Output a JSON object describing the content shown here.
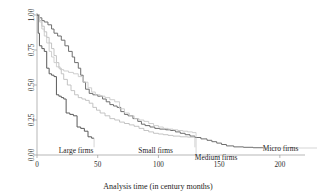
{
  "chart_data": {
    "type": "line",
    "title": "",
    "xlabel": "Analysis time (in century months)",
    "ylabel": "",
    "xlim": [
      0,
      210
    ],
    "ylim": [
      0,
      1.0
    ],
    "xticks": [
      "0",
      "50",
      "100",
      "150",
      "200"
    ],
    "xtick_values": [
      0,
      50,
      100,
      150,
      200
    ],
    "yticks": [
      "0.00",
      "0.25",
      "0.50",
      "0.75",
      "1.00"
    ],
    "ytick_values": [
      0.0,
      0.25,
      0.5,
      0.75,
      1.0
    ],
    "grid": false,
    "legend_position": "inline-annotations",
    "series": [
      {
        "name": "Micro firms",
        "color": "#6e6e6e",
        "width": 1.0,
        "label_x": 186,
        "label_y": 0.055,
        "points": [
          [
            0,
            1.0
          ],
          [
            2,
            0.98
          ],
          [
            4,
            0.96
          ],
          [
            6,
            0.95
          ],
          [
            9,
            0.93
          ],
          [
            12,
            0.9
          ],
          [
            14,
            0.87
          ],
          [
            17,
            0.85
          ],
          [
            20,
            0.82
          ],
          [
            23,
            0.78
          ],
          [
            26,
            0.74
          ],
          [
            29,
            0.7
          ],
          [
            31,
            0.66
          ],
          [
            34,
            0.62
          ],
          [
            36,
            0.57
          ],
          [
            38,
            0.52
          ],
          [
            40,
            0.47
          ],
          [
            43,
            0.44
          ],
          [
            46,
            0.43
          ],
          [
            50,
            0.42
          ],
          [
            54,
            0.4
          ],
          [
            57,
            0.38
          ],
          [
            60,
            0.36
          ],
          [
            63,
            0.35
          ],
          [
            66,
            0.34
          ],
          [
            69,
            0.31
          ],
          [
            72,
            0.29
          ],
          [
            75,
            0.28
          ],
          [
            79,
            0.26
          ],
          [
            83,
            0.24
          ],
          [
            86,
            0.22
          ],
          [
            89,
            0.21
          ],
          [
            93,
            0.2
          ],
          [
            97,
            0.19
          ],
          [
            101,
            0.185
          ],
          [
            106,
            0.18
          ],
          [
            110,
            0.175
          ],
          [
            114,
            0.165
          ],
          [
            118,
            0.155
          ],
          [
            122,
            0.145
          ],
          [
            126,
            0.135
          ],
          [
            130,
            0.125
          ],
          [
            135,
            0.115
          ],
          [
            140,
            0.105
          ],
          [
            144,
            0.095
          ],
          [
            148,
            0.085
          ],
          [
            152,
            0.075
          ],
          [
            156,
            0.065
          ],
          [
            162,
            0.058
          ],
          [
            170,
            0.055
          ],
          [
            178,
            0.052
          ],
          [
            186,
            0.05
          ]
        ]
      },
      {
        "name": "Small firms",
        "color": "#bdbdbd",
        "width": 0.9,
        "label_x": 112,
        "label_y": 0.045,
        "points": [
          [
            0,
            1.0
          ],
          [
            2,
            0.96
          ],
          [
            4,
            0.92
          ],
          [
            6,
            0.88
          ],
          [
            8,
            0.84
          ],
          [
            10,
            0.8
          ],
          [
            12,
            0.76
          ],
          [
            14,
            0.71
          ],
          [
            16,
            0.66
          ],
          [
            18,
            0.62
          ],
          [
            20,
            0.58
          ],
          [
            22,
            0.54
          ],
          [
            25,
            0.5
          ],
          [
            28,
            0.46
          ],
          [
            31,
            0.43
          ],
          [
            34,
            0.41
          ],
          [
            37,
            0.4
          ],
          [
            40,
            0.39
          ],
          [
            43,
            0.37
          ],
          [
            46,
            0.34
          ],
          [
            49,
            0.32
          ],
          [
            52,
            0.3
          ],
          [
            56,
            0.28
          ],
          [
            60,
            0.26
          ],
          [
            64,
            0.25
          ],
          [
            68,
            0.235
          ],
          [
            72,
            0.225
          ],
          [
            76,
            0.215
          ],
          [
            80,
            0.205
          ],
          [
            84,
            0.19
          ],
          [
            88,
            0.175
          ],
          [
            92,
            0.165
          ],
          [
            96,
            0.155
          ],
          [
            100,
            0.15
          ],
          [
            104,
            0.145
          ],
          [
            108,
            0.14
          ],
          [
            112,
            0.135
          ],
          [
            118,
            0.13
          ],
          [
            124,
            0.128
          ],
          [
            130,
            0.125
          ]
        ]
      },
      {
        "name": "Medium firms",
        "color": "#c9c9c9",
        "width": 0.9,
        "label_x": 130,
        "label_y": -0.01,
        "points": [
          [
            0,
            1.0
          ],
          [
            2,
            0.95
          ],
          [
            4,
            0.9
          ],
          [
            6,
            0.85
          ],
          [
            8,
            0.8
          ],
          [
            10,
            0.74
          ],
          [
            12,
            0.7
          ],
          [
            14,
            0.66
          ],
          [
            16,
            0.63
          ],
          [
            19,
            0.61
          ],
          [
            22,
            0.6
          ],
          [
            26,
            0.59
          ],
          [
            30,
            0.58
          ],
          [
            34,
            0.56
          ],
          [
            38,
            0.52
          ],
          [
            42,
            0.48
          ],
          [
            45,
            0.45
          ],
          [
            48,
            0.43
          ],
          [
            52,
            0.42
          ],
          [
            56,
            0.41
          ],
          [
            60,
            0.395
          ],
          [
            64,
            0.38
          ],
          [
            68,
            0.33
          ],
          [
            72,
            0.3
          ],
          [
            76,
            0.28
          ],
          [
            80,
            0.26
          ],
          [
            84,
            0.25
          ],
          [
            88,
            0.24
          ],
          [
            92,
            0.225
          ],
          [
            96,
            0.21
          ],
          [
            100,
            0.2
          ],
          [
            104,
            0.19
          ],
          [
            108,
            0.185
          ],
          [
            112,
            0.18
          ],
          [
            116,
            0.175
          ],
          [
            120,
            0.17
          ],
          [
            124,
            0.165
          ],
          [
            128,
            0.16
          ],
          [
            131,
            0.155
          ]
        ]
      },
      {
        "name": "Large firms",
        "color": "#5a5a5a",
        "width": 1.0,
        "label_x": 18,
        "label_y": 0.04,
        "points": [
          [
            0,
            1.0
          ],
          [
            1,
            0.87
          ],
          [
            2,
            0.78
          ],
          [
            4,
            0.76
          ],
          [
            6,
            0.74
          ],
          [
            8,
            0.62
          ],
          [
            10,
            0.58
          ],
          [
            12,
            0.57
          ],
          [
            14,
            0.56
          ],
          [
            16,
            0.43
          ],
          [
            18,
            0.42
          ],
          [
            20,
            0.41
          ],
          [
            22,
            0.4
          ],
          [
            24,
            0.3
          ],
          [
            27,
            0.29
          ],
          [
            30,
            0.28
          ],
          [
            33,
            0.2
          ],
          [
            36,
            0.19
          ],
          [
            39,
            0.17
          ],
          [
            42,
            0.13
          ],
          [
            45,
            0.12
          ],
          [
            47,
            0.12
          ]
        ]
      }
    ],
    "annotations": [
      {
        "text": "Large firms",
        "x": 18,
        "y": 0.04
      },
      {
        "text": "Small firms",
        "x": 112,
        "y": 0.045
      },
      {
        "text": "Medium firms",
        "x": 130,
        "y": -0.01
      },
      {
        "text": "Micro firms",
        "x": 186,
        "y": 0.055
      }
    ]
  }
}
